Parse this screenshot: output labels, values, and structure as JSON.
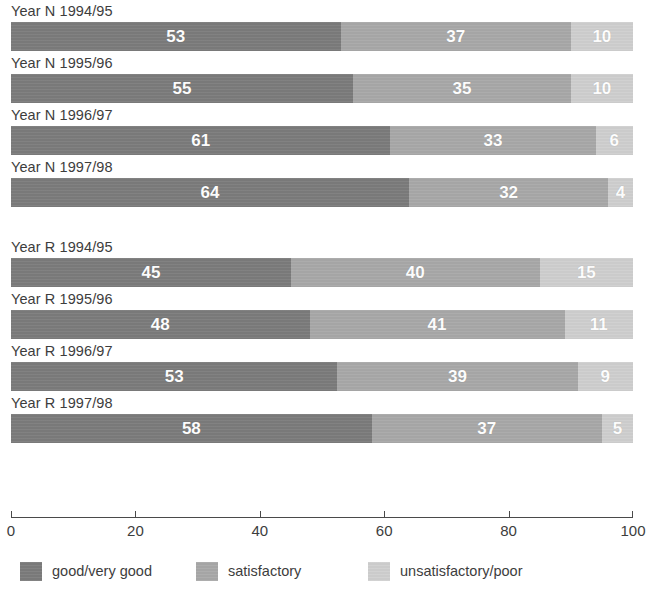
{
  "chart_data": {
    "type": "bar",
    "subtype": "horizontal-stacked-100",
    "title": "",
    "subtitle": "",
    "xlabel": "",
    "ylabel": "",
    "xlim": [
      0,
      100
    ],
    "xticks": [
      0,
      20,
      40,
      60,
      80,
      100
    ],
    "xtick_labels": [
      "0",
      "20",
      "40",
      "60",
      "80",
      "100"
    ],
    "grid": false,
    "legend_position": "bottom",
    "categories": [
      "Year N 1994/95",
      "Year N 1995/96",
      "Year N 1996/97",
      "Year N 1997/98",
      "Year R 1994/95",
      "Year R 1995/96",
      "Year R 1996/97",
      "Year R 1997/98"
    ],
    "series": [
      {
        "name": "good/very good",
        "color": "#7b7b7b",
        "values": [
          53,
          55,
          61,
          64,
          45,
          48,
          53,
          58
        ]
      },
      {
        "name": "satisfactory",
        "color": "#a8a8a8",
        "values": [
          37,
          35,
          33,
          32,
          40,
          41,
          39,
          37
        ]
      },
      {
        "name": "unsatisfactory/poor",
        "color": "#cfcfcf",
        "values": [
          10,
          10,
          6,
          4,
          15,
          11,
          9,
          5
        ]
      }
    ],
    "groups": [
      {
        "name": "Year N",
        "rows": [
          {
            "label": "Year N 1994/95",
            "segments": [
              53,
              37,
              10
            ]
          },
          {
            "label": "Year N 1995/96",
            "segments": [
              55,
              35,
              10
            ]
          },
          {
            "label": "Year N 1996/97",
            "segments": [
              61,
              33,
              6
            ]
          },
          {
            "label": "Year N 1997/98",
            "segments": [
              64,
              32,
              4
            ]
          }
        ]
      },
      {
        "name": "Year R",
        "rows": [
          {
            "label": "Year R 1994/95",
            "segments": [
              45,
              40,
              15
            ]
          },
          {
            "label": "Year R 1995/96",
            "segments": [
              48,
              41,
              11
            ]
          },
          {
            "label": "Year R 1996/97",
            "segments": [
              53,
              39,
              9
            ]
          },
          {
            "label": "Year R 1997/98",
            "segments": [
              58,
              37,
              5
            ]
          }
        ]
      }
    ]
  },
  "rows": [
    {
      "label": "Year N 1994/95",
      "values": [
        "53",
        "37",
        "10"
      ],
      "group": 0
    },
    {
      "label": "Year N 1995/96",
      "values": [
        "55",
        "35",
        "10"
      ],
      "group": 0
    },
    {
      "label": "Year N 1996/97",
      "values": [
        "61",
        "33",
        "6"
      ],
      "group": 0
    },
    {
      "label": "Year N 1997/98",
      "values": [
        "64",
        "32",
        "4"
      ],
      "group": 0
    },
    {
      "label": "Year R 1994/95",
      "values": [
        "45",
        "40",
        "15"
      ],
      "group": 1
    },
    {
      "label": "Year R 1995/96",
      "values": [
        "48",
        "41",
        "11"
      ],
      "group": 1
    },
    {
      "label": "Year R 1996/97",
      "values": [
        "53",
        "39",
        "9"
      ],
      "group": 1
    },
    {
      "label": "Year R 1997/98",
      "values": [
        "58",
        "37",
        "5"
      ],
      "group": 1
    }
  ],
  "axis": {
    "ticks": [
      "0",
      "20",
      "40",
      "60",
      "80",
      "100"
    ],
    "min": 0,
    "max": 100
  },
  "legend": {
    "items": [
      {
        "label": "good/very good",
        "color": "#7b7b7b"
      },
      {
        "label": "satisfactory",
        "color": "#a8a8a8"
      },
      {
        "label": "unsatisfactory/poor",
        "color": "#cfcfcf"
      }
    ]
  },
  "colors": {
    "good": "#7b7b7b",
    "satisfactory": "#a8a8a8",
    "unsatisfactory": "#cfcfcf",
    "axis": "#4a4a4a",
    "text": "#3d3d3d",
    "value_text": "#ffffff",
    "background": "#ffffff"
  }
}
